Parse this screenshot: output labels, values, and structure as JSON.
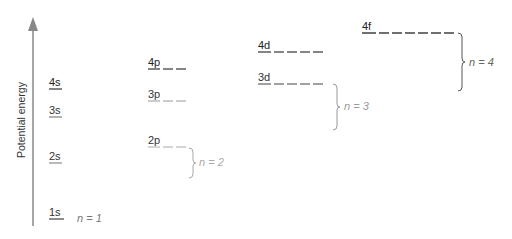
{
  "axis": {
    "label": "Potential energy"
  },
  "levels": {
    "s4": "4s",
    "s3": "3s",
    "s2": "2s",
    "s1": "1s",
    "p4": "4p",
    "p3": "3p",
    "p2": "2p",
    "d4": "4d",
    "d3": "3d",
    "f4": "4f"
  },
  "shells": {
    "n1": "n = 1",
    "n2": "n = 2",
    "n3": "n = 3",
    "n4": "n = 4"
  }
}
